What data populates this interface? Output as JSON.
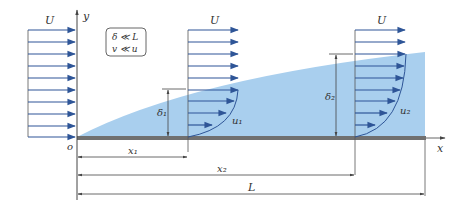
{
  "colors": {
    "fluid_region": "#a9cfee",
    "arrow": "#2e5597",
    "plate": "#707070",
    "line": "#555555",
    "text": "#333333"
  },
  "labels": {
    "free_stream_left": "U",
    "free_stream_1": "U",
    "free_stream_2": "U",
    "y_axis": "y",
    "x_axis": "x",
    "origin": "o",
    "delta_1": "δ₁",
    "delta_2": "δ₂",
    "u_1": "u₁",
    "u_2": "u₂",
    "x_1": "x₁",
    "x_2": "x₂",
    "length": "L"
  },
  "assumptions": {
    "line1": "δ ≪ L",
    "line2": "v ≪ u"
  }
}
